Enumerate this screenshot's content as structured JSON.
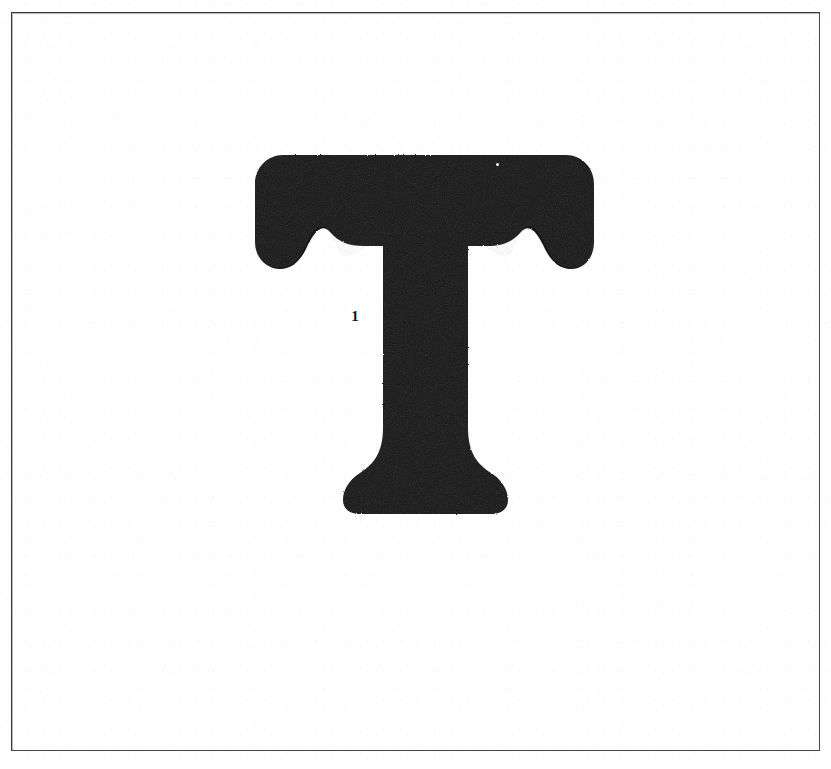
{
  "document": {
    "kind": "scanned-page",
    "title": "Letter Specimen Plate",
    "page_background": "#fefefe",
    "ink_color": "#141417",
    "rule_color": "#3a3a3c"
  },
  "frame": {
    "name": "border-rule",
    "left": 11,
    "top": 12,
    "width": 809,
    "height": 739,
    "stroke_width": 1.6,
    "stroke_color": "#3a3a3c"
  },
  "specimen": {
    "character": "T",
    "description": "Capital letter T, slab-serif / Clarendon style with bracketed serifs",
    "fill_color": "#141417",
    "bounds": {
      "left": 255,
      "top": 155,
      "right": 594,
      "bottom": 514
    },
    "metrics": {
      "cap_width": 339,
      "cap_height": 359,
      "bar_top": 155,
      "bar_bottom": 232,
      "stem_left": 368,
      "stem_right": 468,
      "stem_width": 100,
      "foot_left": 343,
      "foot_right": 508,
      "foot_bottom": 514
    }
  },
  "marks": [
    {
      "name": "stem-mark",
      "label": "1",
      "x": 349,
      "y": 307,
      "note": "small inked numeral beside the stem"
    },
    {
      "name": "ink-speck",
      "label": "",
      "x": 496,
      "y": 163,
      "note": "white dropout speck inside the top bar"
    }
  ],
  "canvas": {
    "width": 831,
    "height": 769
  }
}
